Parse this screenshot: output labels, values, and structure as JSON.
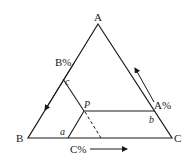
{
  "diagram": {
    "type": "ternary-phase-diagram",
    "vertices": {
      "top": "A",
      "left": "B",
      "right": "C"
    },
    "point": "P",
    "intersections": {
      "left_side": "c",
      "base": "a",
      "horizontal_end": "b"
    },
    "axes": {
      "left": "B%",
      "right": "A%",
      "bottom": "C%"
    },
    "colors": {
      "line": "#1a1a1a",
      "background": "#ffffff"
    }
  }
}
